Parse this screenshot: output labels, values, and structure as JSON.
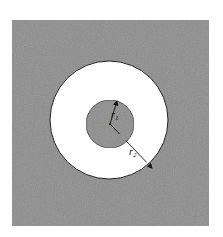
{
  "diagram": {
    "type": "annulus-cross-section",
    "background_color": "#ffffff",
    "square": {
      "fill": "#8e8e8e",
      "x": 12,
      "y": 20,
      "width": 197,
      "height": 206
    },
    "outer_circle": {
      "fill": "#ffffff",
      "stroke": "#222222",
      "cx": 109,
      "cy": 120,
      "r": 59
    },
    "inner_circle": {
      "fill": "#8e8e8e",
      "stroke": "#333333",
      "cx": 110,
      "cy": 124,
      "r": 24
    },
    "center": {
      "x": 110,
      "y": 124
    },
    "labels": {
      "r1": "r",
      "r1_sub": "1",
      "r2": "r",
      "r2_sub": "2"
    },
    "arrows": [
      {
        "name": "r1-arrow",
        "x1": 110,
        "y1": 124,
        "x2": 117,
        "y2": 101
      },
      {
        "name": "r2-arrow",
        "x1": 110,
        "y1": 124,
        "x2": 152,
        "y2": 168
      }
    ]
  }
}
